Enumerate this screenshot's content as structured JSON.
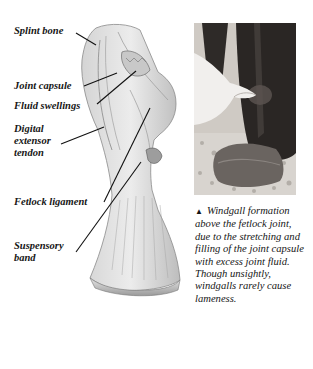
{
  "illustration": {
    "labels": [
      {
        "id": "splint-bone",
        "text": "Splint bone"
      },
      {
        "id": "joint-capsule",
        "text": "Joint capsule"
      },
      {
        "id": "fluid-swellings",
        "text": "Fluid swellings"
      },
      {
        "id": "digital-extensor-tendon",
        "text": "Digital\nextensor\ntendon"
      },
      {
        "id": "fetlock-ligament",
        "text": "Fetlock ligament"
      },
      {
        "id": "suspensory-band",
        "text": "Suspensory\nband"
      }
    ]
  },
  "photo": {
    "subject": "horse-leg-windgall-photo"
  },
  "caption": {
    "marker": "▲",
    "text": "Windgall formation above the fetlock joint, due to the stretching and filling of the joint capsule with excess joint fluid.  Though unsightly, windgalls rarely cause lameness."
  },
  "colors": {
    "background": "#ffffff",
    "text": "#161616",
    "drawing_stroke": "#7a7a7a",
    "photo_dark": "#2a2624"
  }
}
